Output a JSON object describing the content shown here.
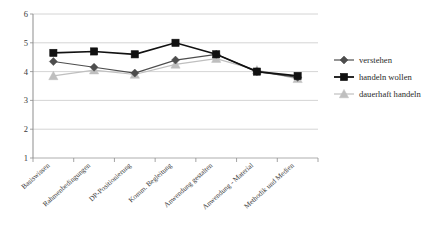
{
  "chart_data": {
    "type": "line",
    "title": "",
    "subtitle": "",
    "xlabel": "",
    "ylabel": "",
    "ylim": [
      1,
      6
    ],
    "yticks": [
      1,
      2,
      3,
      4,
      5,
      6
    ],
    "grid": true,
    "legend_position": "right",
    "categories": [
      "Basiswissen",
      "Rahmenbedingungen",
      "DP-Positionierung",
      "Komm. Begleitung",
      "Anwendung gestalten",
      "Anwendung - Material",
      "Methodik und Medien"
    ],
    "series": [
      {
        "name": "verstehen",
        "marker": "diamond",
        "color": "#4d4d4d",
        "values": [
          4.35,
          4.15,
          3.95,
          4.4,
          4.6,
          4.0,
          3.8
        ]
      },
      {
        "name": "handeln wollen",
        "marker": "square",
        "color": "#111111",
        "values": [
          4.65,
          4.7,
          4.6,
          5.0,
          4.6,
          4.0,
          3.85
        ]
      },
      {
        "name": "dauerhaft handeln",
        "marker": "triangle",
        "color": "#bfbfbf",
        "values": [
          3.85,
          4.05,
          3.9,
          4.25,
          4.45,
          4.05,
          3.75
        ]
      }
    ]
  },
  "axis": {
    "y_tick_labels": [
      "6",
      "5",
      "4",
      "3",
      "2",
      "1"
    ]
  },
  "legend": {
    "items": [
      {
        "label": "verstehen"
      },
      {
        "label": "handeln wollen"
      },
      {
        "label": "dauerhaft handeln"
      }
    ]
  }
}
